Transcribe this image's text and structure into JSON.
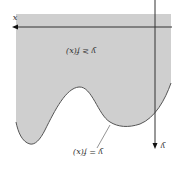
{
  "diagram": {
    "region_label": "y ≥ f(x)",
    "curve_label": "y = f(x)",
    "x_axis_label": "x",
    "y_axis_label": "y",
    "colors": {
      "region_fill": "#cfcfcf",
      "curve": "#555555",
      "axis": "#333333",
      "background": "#ffffff"
    }
  }
}
